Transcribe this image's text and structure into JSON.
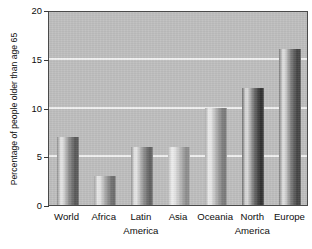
{
  "chart_data": {
    "type": "bar",
    "title": "",
    "xlabel": "",
    "ylabel": "Percentage of people older than age 65",
    "categories": [
      "World",
      "Africa",
      "Latin America",
      "Asia",
      "Oceania",
      "North America",
      "Europe"
    ],
    "category_lines": [
      [
        "World"
      ],
      [
        "Africa"
      ],
      [
        "Latin",
        "America"
      ],
      [
        "Asia"
      ],
      [
        "Oceania"
      ],
      [
        "North",
        "America"
      ],
      [
        "Europe"
      ]
    ],
    "values": [
      7,
      3,
      6,
      6,
      10,
      12,
      16
    ],
    "ylim": [
      0,
      20
    ],
    "yticks": [
      0,
      5,
      10,
      15,
      20
    ],
    "ytick_labels": [
      "0",
      "5",
      "10",
      "15",
      "20"
    ],
    "gridlines": [
      5,
      10,
      15
    ],
    "grid": true,
    "grid_color": "#f2f2f2",
    "legend": null,
    "plot_background": "#bfbfbf",
    "bar_shades": [
      {
        "category": "World",
        "light": "#e2e2e2",
        "mid": "#8f8f8f",
        "dark": "#5a5a5a"
      },
      {
        "category": "Africa",
        "light": "#e6e6e6",
        "mid": "#a2a2a2",
        "dark": "#6e6e6e"
      },
      {
        "category": "Latin America",
        "light": "#e4e4e4",
        "mid": "#979797",
        "dark": "#636363"
      },
      {
        "category": "Asia",
        "light": "#ececec",
        "mid": "#bcbcbc",
        "dark": "#8e8e8e"
      },
      {
        "category": "Oceania",
        "light": "#e9e9e9",
        "mid": "#ababab",
        "dark": "#7c7c7c"
      },
      {
        "category": "North America",
        "light": "#d8d8d8",
        "mid": "#6f6f6f",
        "dark": "#333333"
      },
      {
        "category": "Europe",
        "light": "#dcdcdc",
        "mid": "#7d7d7d",
        "dark": "#454545"
      }
    ]
  }
}
